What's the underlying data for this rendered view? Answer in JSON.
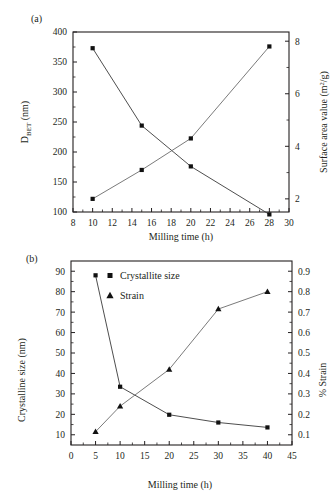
{
  "figure": {
    "panel_a_label": "(a)",
    "panel_b_label": "(b)"
  },
  "chart_data": [
    {
      "id": "panel-a",
      "type": "line",
      "panel_label": "(a)",
      "title": "",
      "xlabel": "Milling time (h)",
      "ylabel_left_main": "D",
      "ylabel_left_sub": "BET",
      "ylabel_left_unit": " (nm)",
      "ylabel_left_full": "D_BET (nm)",
      "ylabel_right_main": "Surface area value (m",
      "ylabel_right_sup": "2",
      "ylabel_right_tail": "/g)",
      "ylabel_right_full": "Surface area value (m2/g)",
      "x": [
        10,
        15,
        20,
        28
      ],
      "xlim": [
        8,
        30
      ],
      "xticks": [
        8,
        10,
        12,
        14,
        16,
        18,
        20,
        22,
        24,
        26,
        28,
        30
      ],
      "xticklabels": [
        "8",
        "10",
        "12",
        "14",
        "16",
        "18",
        "20",
        "22",
        "24",
        "26",
        "28",
        "30"
      ],
      "ylim_left": [
        100,
        400
      ],
      "yticks_left": [
        100,
        150,
        200,
        250,
        300,
        350,
        400
      ],
      "yticklabels_left": [
        "100",
        "150",
        "200",
        "250",
        "300",
        "350",
        "400"
      ],
      "ylim_right": [
        1.5,
        8.35
      ],
      "yticks_right": [
        2,
        4,
        6,
        8
      ],
      "yticklabels_right": [
        "2",
        "4",
        "6",
        "8"
      ],
      "grid": false,
      "legend": "none",
      "series": [
        {
          "name": "D_BET (nm)",
          "axis": "left",
          "marker": "square",
          "values": [
            373,
            244,
            176,
            96
          ]
        },
        {
          "name": "Surface area value (m2/g)",
          "axis": "right",
          "marker": "square",
          "values": [
            2.0,
            3.1,
            4.3,
            7.8
          ]
        }
      ]
    },
    {
      "id": "panel-b",
      "type": "line",
      "panel_label": "(b)",
      "title": "",
      "xlabel": "Milling time (h)",
      "ylabel_left_full": "Crystalline size (nm)",
      "ylabel_right_full": "% Strain",
      "x": [
        5,
        10,
        20,
        30,
        40
      ],
      "xlim": [
        0,
        45
      ],
      "xticks": [
        0,
        5,
        10,
        15,
        20,
        25,
        30,
        35,
        40,
        45
      ],
      "xticklabels": [
        "0",
        "5",
        "10",
        "15",
        "20",
        "25",
        "30",
        "35",
        "40",
        "45"
      ],
      "ylim_left": [
        5,
        95
      ],
      "yticks_left": [
        10,
        20,
        30,
        40,
        50,
        60,
        70,
        80,
        90
      ],
      "yticklabels_left": [
        "10",
        "20",
        "30",
        "40",
        "50",
        "60",
        "70",
        "80",
        "90"
      ],
      "ylim_right": [
        0.05,
        0.95
      ],
      "yticks_right": [
        0.1,
        0.2,
        0.3,
        0.4,
        0.5,
        0.6,
        0.7,
        0.8,
        0.9
      ],
      "yticklabels_right": [
        "0.1",
        "0.2",
        "0.3",
        "0.4",
        "0.5",
        "0.6",
        "0.7",
        "0.8",
        "0.9"
      ],
      "grid": false,
      "legend": "upper-left-inside",
      "legend_entries": [
        {
          "label": "Crystallite size",
          "marker": "square"
        },
        {
          "label": "Strain",
          "marker": "triangle"
        }
      ],
      "series": [
        {
          "name": "Crystallite size",
          "axis": "left",
          "marker": "square",
          "values": [
            88,
            33.5,
            19.8,
            16.0,
            13.6
          ]
        },
        {
          "name": "Strain",
          "axis": "right",
          "marker": "triangle",
          "values": [
            0.115,
            0.24,
            0.42,
            0.715,
            0.8
          ]
        }
      ]
    }
  ],
  "colors": {
    "ink": "#231f20",
    "line_dark": "#3a3a3a",
    "line_light": "#6b6b6b",
    "marker": "#111111",
    "background": "#ffffff"
  }
}
